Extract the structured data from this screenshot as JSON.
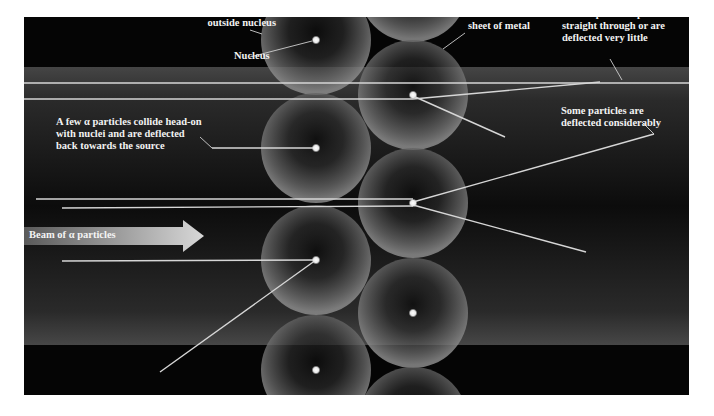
{
  "diagram": {
    "colors": {
      "background_band": "#060606",
      "beam_band": "#3a3a3a",
      "ray": "#d8d8d8",
      "nucleus": "#f4f4f4",
      "label_text": "#f2f2f2"
    },
    "labels": {
      "electrons": [
        "Electrons occupy space",
        "outside nucleus"
      ],
      "nucleus": "Nucleus",
      "atoms": [
        "Atoms in thin",
        "sheet of metal"
      ],
      "most_pass": [
        "Most α particles pass",
        "straight through or are",
        "deflected very little"
      ],
      "few_collide": [
        "A few α particles collide head-on",
        "with nuclei and are deflected",
        "back towards the source"
      ],
      "some_deflected": [
        "Some particles are",
        "deflected considerably"
      ],
      "beam": "Beam of α particles"
    },
    "atoms": {
      "left_column_x": 316,
      "right_column_x": 413,
      "radius": 55,
      "left_centers_y": [
        40,
        148,
        260,
        370
      ],
      "right_centers_y": [
        -12,
        95,
        203,
        313,
        420
      ]
    },
    "icons": {
      "beam_arrow": "right-arrow-icon",
      "nucleus": "dot-icon"
    }
  }
}
